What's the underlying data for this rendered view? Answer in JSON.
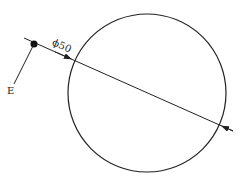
{
  "diagram": {
    "circle": {
      "cx": 147,
      "cy": 93,
      "r": 79
    },
    "diameter_line": {
      "x1": 24,
      "y1": 38,
      "x2": 233,
      "y2": 131
    },
    "dimension_label": "ϕ50",
    "point_marker": {
      "cx": 34,
      "cy": 44,
      "r": 3.5
    },
    "leader": {
      "x1": 34,
      "y1": 44,
      "x2": 14,
      "y2": 84
    },
    "point_label": "E",
    "colors": {
      "stroke": "#222222",
      "background": "#ffffff"
    }
  }
}
